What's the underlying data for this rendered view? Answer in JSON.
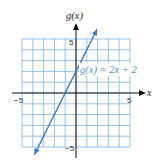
{
  "chart_data": {
    "type": "line",
    "title": "",
    "xlabel": "x",
    "ylabel": "g(x)",
    "xlim": [
      -5,
      5
    ],
    "ylim": [
      -5,
      5
    ],
    "grid": true,
    "tick_labels": {
      "x_min": "−5",
      "x_max": "5",
      "y_max": "5",
      "y_min": "−5"
    },
    "series": [
      {
        "name": "g(x) = 2x + 2",
        "equation": "g(x) = 2x + 2",
        "slope": 2,
        "intercept": 2,
        "x": [
          -4,
          -3,
          -2,
          -1,
          0,
          1,
          2
        ],
        "values": [
          -6,
          -4,
          -2,
          0,
          2,
          4,
          6
        ]
      }
    ],
    "annotation": "g(x) = 2x + 2",
    "colors": {
      "grid": "#7fb3e0",
      "line": "#3a78c9",
      "axes": "#111111",
      "label": "#4f8fd6"
    }
  },
  "labels": {
    "y_axis": "g(x)",
    "x_axis": "x",
    "equation": "g(x) = 2x + 2",
    "tick_neg5_x": "−5",
    "tick_5_x": "5",
    "tick_5_y": "5",
    "tick_neg5_y": "−5"
  }
}
